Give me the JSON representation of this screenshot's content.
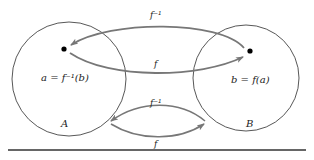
{
  "diagram": {
    "sets": [
      {
        "name": "A",
        "element_label": "a = f⁻¹(b)"
      },
      {
        "name": "B",
        "element_label": "b = f(a)"
      }
    ],
    "arrows": [
      {
        "from": "B",
        "to": "A",
        "label": "f⁻¹",
        "position": "top"
      },
      {
        "from": "A",
        "to": "B",
        "label": "f",
        "position": "top"
      },
      {
        "from": "B",
        "to": "A",
        "label": "f⁻¹",
        "position": "bottom"
      },
      {
        "from": "A",
        "to": "B",
        "label": "f",
        "position": "bottom"
      }
    ],
    "labels": {
      "set_a": "A",
      "set_b": "B",
      "elem_a": "a = f⁻¹(b)",
      "elem_b": "b = f(a)",
      "top_inverse": "f⁻¹",
      "top_forward": "f",
      "bottom_inverse": "f⁻¹",
      "bottom_forward": "f"
    },
    "colors": {
      "circle_stroke": "#444444",
      "arrow_stroke": "#777777",
      "dot": "#000000",
      "rule": "#333333"
    }
  }
}
